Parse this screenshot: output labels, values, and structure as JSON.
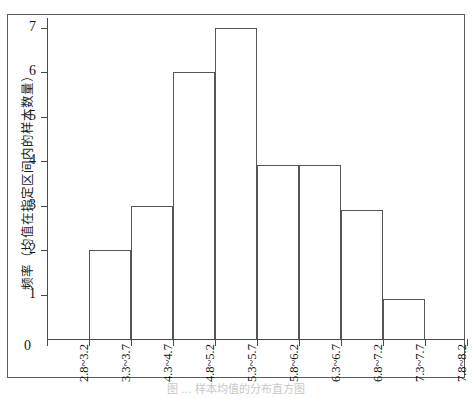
{
  "chart_data": {
    "type": "bar",
    "title": "",
    "subtitle": "",
    "xlabel": "",
    "ylabel": "频率（均值在指定区间内的样本数量）",
    "categories": [
      "2.8~3.2",
      "3.3~3.7",
      "4.3~4.7",
      "4.8~5.2",
      "5.3~5.7",
      "5.8~6.2",
      "6.3~6.7",
      "6.8~7.2",
      "7.3~7.7",
      "7.8~8.2"
    ],
    "values": [
      0,
      2,
      3,
      6,
      7,
      3.9,
      3.9,
      2.9,
      0.9,
      0
    ],
    "ylim": [
      0,
      7.2
    ],
    "yticks": [
      0,
      1,
      2,
      3,
      4,
      5,
      6,
      7
    ],
    "ytick_labels": [
      "0",
      "1",
      "2",
      "3",
      "4",
      "5",
      "6",
      "7"
    ],
    "grid": false,
    "legend": "none",
    "bar_fill": "#ffffff",
    "bar_stroke": "#555555",
    "axis_color": "#4a4a4a",
    "background": "#ffffff"
  },
  "figure": {
    "origin_label": "0",
    "caption": "图 … 样本均值的分布直方图"
  }
}
